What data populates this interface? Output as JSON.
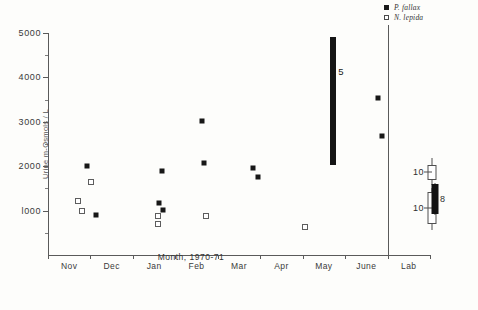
{
  "chart_data": {
    "type": "scatter",
    "title": "",
    "xlabel": "Month, 1970-71",
    "ylabel": "Urine m-Osmols / L",
    "ylim": [
      0,
      5000
    ],
    "yticks": [
      1000,
      2000,
      3000,
      4000,
      5000
    ],
    "ytick_labels": [
      "l000",
      "2000",
      "3000",
      "4000",
      "5000"
    ],
    "categories": [
      "Nov",
      "Dec",
      "Jan",
      "Feb",
      "Mar",
      "Apr",
      "May",
      "June",
      "Lab"
    ],
    "grid": false,
    "legend_position": "top-right",
    "series": [
      {
        "name": "P. fallax",
        "marker": "filled-square",
        "points": [
          {
            "x": 0.42,
            "y": 2010
          },
          {
            "x": 0.62,
            "y": 900
          },
          {
            "x": 2.18,
            "y": 1890
          },
          {
            "x": 2.12,
            "y": 1180
          },
          {
            "x": 2.2,
            "y": 1020
          },
          {
            "x": 3.12,
            "y": 3010
          },
          {
            "x": 3.18,
            "y": 2080
          },
          {
            "x": 4.32,
            "y": 1960
          },
          {
            "x": 4.45,
            "y": 1760
          },
          {
            "x": 7.28,
            "y": 3530
          },
          {
            "x": 7.36,
            "y": 2690
          }
        ]
      },
      {
        "name": "N. lepida",
        "marker": "open-square",
        "points": [
          {
            "x": 0.2,
            "y": 1210
          },
          {
            "x": 0.52,
            "y": 1650
          },
          {
            "x": 0.3,
            "y": 990
          },
          {
            "x": 2.08,
            "y": 880
          },
          {
            "x": 2.08,
            "y": 700
          },
          {
            "x": 3.22,
            "y": 870
          },
          {
            "x": 5.55,
            "y": 640
          }
        ]
      }
    ],
    "range_bars": [
      {
        "name": "may-bar",
        "x": 6.22,
        "low": 2020,
        "high": 4900,
        "label": "5",
        "fill": "filled"
      }
    ],
    "lab_ranges": [
      {
        "name": "lab-open-range",
        "x": 8.55,
        "whisker_low": 1580,
        "whisker_high": 2180,
        "box_low": 1700,
        "box_high": 2030,
        "label": "10",
        "fill": "open"
      },
      {
        "name": "lab-lower-open-range",
        "x": 8.55,
        "whisker_low": 560,
        "whisker_high": 1520,
        "box_low": 700,
        "box_high": 1420,
        "label": "10",
        "fill": "open"
      },
      {
        "name": "lab-filled-range",
        "x": 8.62,
        "whisker_low": 900,
        "whisker_high": 1620,
        "box_low": 930,
        "box_high": 1600,
        "label": "8",
        "fill": "filled"
      }
    ]
  },
  "legend": {
    "entries": [
      {
        "label": "P. fallax",
        "marker": "filled-square"
      },
      {
        "label": "N. lepida",
        "marker": "open-square"
      }
    ]
  }
}
